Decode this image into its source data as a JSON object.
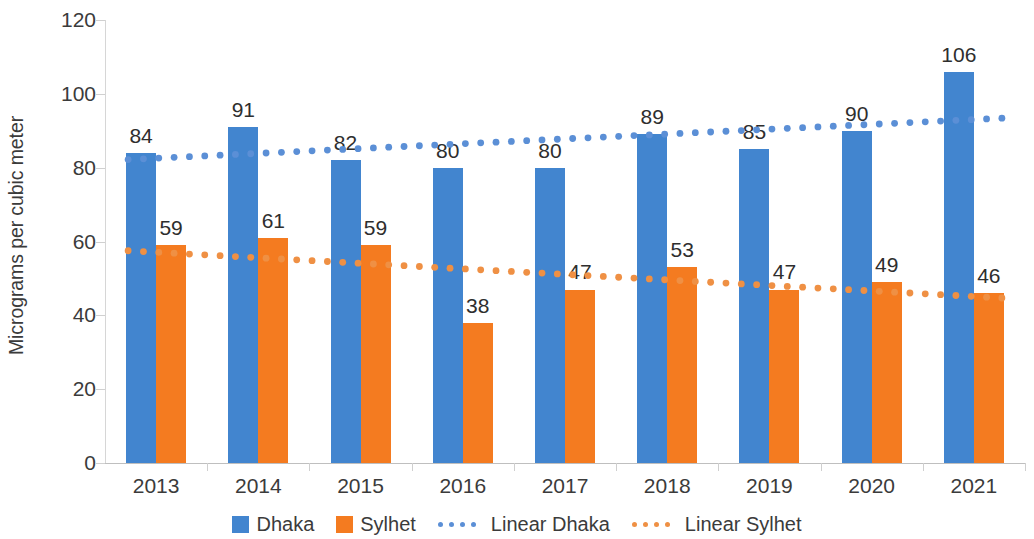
{
  "chart_data": {
    "type": "bar",
    "title": "",
    "subtitle": "",
    "xlabel": "",
    "ylabel": "Micrograms per cubic meter",
    "categories": [
      "2013",
      "2014",
      "2015",
      "2016",
      "2017",
      "2018",
      "2019",
      "2020",
      "2021"
    ],
    "series": [
      {
        "name": "Dhaka",
        "kind": "bar",
        "color": "#4285cf",
        "values": [
          84,
          91,
          82,
          80,
          80,
          89,
          85,
          90,
          106
        ]
      },
      {
        "name": "Sylhet",
        "kind": "bar",
        "color": "#f47b20",
        "values": [
          59,
          61,
          59,
          38,
          47,
          53,
          47,
          49,
          46
        ]
      },
      {
        "name": "Linear Dhaka",
        "kind": "trendline-dotted",
        "color": "#5b8fd6",
        "values": [
          82.2,
          83.6,
          85.0,
          86.4,
          87.8,
          89.2,
          90.6,
          92.0,
          93.4
        ]
      },
      {
        "name": "Linear Sylhet",
        "kind": "trendline-dotted",
        "color": "#ef9044",
        "values": [
          57.5,
          55.9,
          54.3,
          52.7,
          51.1,
          49.5,
          47.9,
          46.3,
          44.7
        ]
      }
    ],
    "ylim": [
      0,
      120
    ],
    "y_ticks": [
      0,
      20,
      40,
      60,
      80,
      100,
      120
    ],
    "y_tick_labels": [
      "0",
      "20",
      "40",
      "60",
      "80",
      "100",
      "120"
    ],
    "grid": false,
    "legend_position": "bottom",
    "data_labels_shown": true
  },
  "legend": {
    "items": [
      {
        "label": "Dhaka",
        "marker": "square-swatch",
        "color": "#4285cf"
      },
      {
        "label": "Sylhet",
        "marker": "square-swatch",
        "color": "#f47b20"
      },
      {
        "label": "Linear Dhaka",
        "marker": "dotted-line",
        "color": "#5b8fd6"
      },
      {
        "label": "Linear Sylhet",
        "marker": "dotted-line",
        "color": "#ef9044"
      }
    ]
  },
  "axis": {
    "y_title": "Micrograms per cubic meter"
  }
}
